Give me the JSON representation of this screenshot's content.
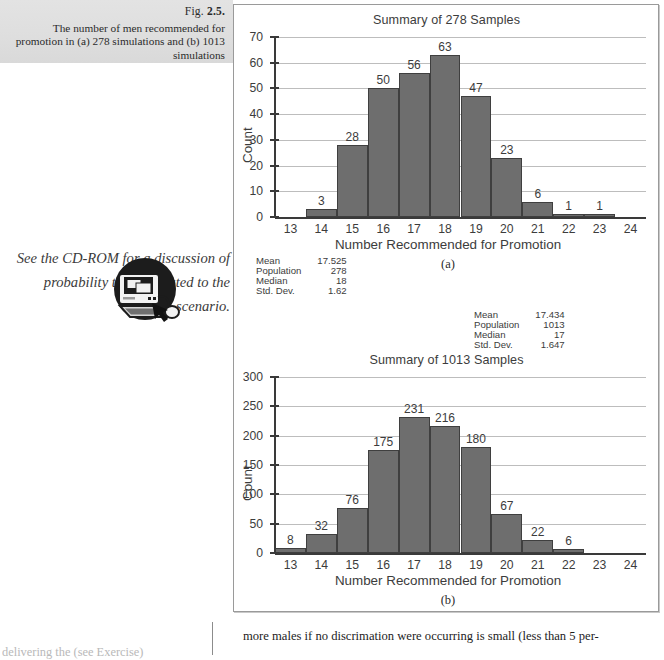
{
  "caption": {
    "fig_prefix": "Fig. ",
    "fig_number": "2.5.",
    "text": "The number of men recommended for promotion in (a) 278 simulations and (b) 1013 simulations"
  },
  "cdrom_note": {
    "text": "See the CD-ROM for a discussion of probability theory related to the scenario.",
    "icon": "cd-rom-computer-icon"
  },
  "body_text": {
    "line": "more males if no discrimation were occurring is small (less than 5 per-"
  },
  "left_column_fragment": {
    "text": "delivering the (see Exercise)"
  },
  "chart_data": [
    {
      "type": "bar",
      "id": "summary-278",
      "title": "Summary of 278 Samples",
      "xlabel": "Number Recommended for Promotion",
      "ylabel": "Count",
      "panel_letter": "(a)",
      "categories": [
        13,
        14,
        15,
        16,
        17,
        18,
        19,
        20,
        21,
        22,
        23,
        24
      ],
      "values": [
        0,
        3,
        28,
        50,
        56,
        63,
        47,
        23,
        6,
        1,
        1,
        0
      ],
      "bar_labels": [
        "",
        "3",
        "28",
        "50",
        "56",
        "63",
        "47",
        "23",
        "6",
        "1",
        "1",
        ""
      ],
      "xlim": [
        12.5,
        24.5
      ],
      "ylim": [
        0,
        70
      ],
      "yticks": [
        0,
        10,
        20,
        30,
        40,
        50,
        60,
        70
      ],
      "xticks": [
        13,
        14,
        15,
        16,
        17,
        18,
        19,
        20,
        21,
        22,
        23,
        24
      ],
      "grid": true,
      "bar_color": "#6e6e6e",
      "bar_border_color": "#3f3f3f",
      "stats": [
        {
          "key": "Mean",
          "value": "17.525"
        },
        {
          "key": "Population",
          "value": "278"
        },
        {
          "key": "Median",
          "value": "18"
        },
        {
          "key": "Std. Dev.",
          "value": "1.62"
        }
      ]
    },
    {
      "type": "bar",
      "id": "summary-1013",
      "title": "Summary of 1013 Samples",
      "xlabel": "Number Recommended for Promotion",
      "ylabel": "Count",
      "panel_letter": "(b)",
      "categories": [
        13,
        14,
        15,
        16,
        17,
        18,
        19,
        20,
        21,
        22,
        23,
        24
      ],
      "values": [
        8,
        32,
        76,
        175,
        231,
        216,
        180,
        67,
        22,
        6,
        0,
        0
      ],
      "bar_labels": [
        "8",
        "32",
        "76",
        "175",
        "231",
        "216",
        "180",
        "67",
        "22",
        "6",
        "",
        ""
      ],
      "xlim": [
        12.5,
        24.5
      ],
      "ylim": [
        0,
        300
      ],
      "yticks": [
        0,
        50,
        100,
        150,
        200,
        250,
        300
      ],
      "xticks": [
        13,
        14,
        15,
        16,
        17,
        18,
        19,
        20,
        21,
        22,
        23,
        24
      ],
      "grid": true,
      "bar_color": "#6e6e6e",
      "bar_border_color": "#3f3f3f",
      "stats": [
        {
          "key": "Mean",
          "value": "17.434"
        },
        {
          "key": "Population",
          "value": "1013"
        },
        {
          "key": "Median",
          "value": "17"
        },
        {
          "key": "Std. Dev.",
          "value": "1.647"
        }
      ]
    }
  ]
}
